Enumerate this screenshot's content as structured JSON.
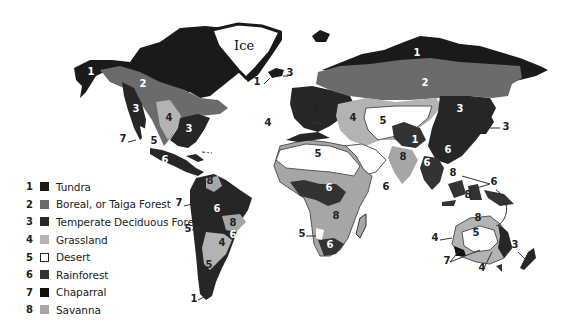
{
  "map": {
    "ice_label": "Ice",
    "colors": {
      "tundra": "#1a1a1a",
      "boreal": "#6b6b6b",
      "temperate": "#262626",
      "grassland": "#b3b3b3",
      "desert": "#ffffff",
      "rainforest": "#333333",
      "chaparral": "#111111",
      "savanna": "#a6a6a6",
      "outline": "#555555"
    },
    "region_labels": [
      {
        "text": "1",
        "x": 91,
        "y": 75
      },
      {
        "text": "2",
        "x": 143,
        "y": 87
      },
      {
        "text": "3",
        "x": 136,
        "y": 112
      },
      {
        "text": "4",
        "x": 169,
        "y": 121
      },
      {
        "text": "3",
        "x": 189,
        "y": 132
      },
      {
        "text": "7",
        "x": 123,
        "y": 142
      },
      {
        "text": "5",
        "x": 154,
        "y": 144
      },
      {
        "text": "6",
        "x": 208,
        "y": 155
      },
      {
        "text": "6",
        "x": 165,
        "y": 163
      },
      {
        "text": "1",
        "x": 257,
        "y": 85
      },
      {
        "text": "3",
        "x": 290,
        "y": 76
      },
      {
        "text": "4",
        "x": 268,
        "y": 126
      },
      {
        "text": "8",
        "x": 210,
        "y": 184
      },
      {
        "text": "7",
        "x": 179,
        "y": 206
      },
      {
        "text": "6",
        "x": 217,
        "y": 212
      },
      {
        "text": "8",
        "x": 233,
        "y": 226
      },
      {
        "text": "5",
        "x": 188,
        "y": 232
      },
      {
        "text": "4",
        "x": 222,
        "y": 246
      },
      {
        "text": "6",
        "x": 233,
        "y": 238
      },
      {
        "text": "5",
        "x": 209,
        "y": 268
      },
      {
        "text": "1",
        "x": 194,
        "y": 302
      },
      {
        "text": "1",
        "x": 417,
        "y": 56
      },
      {
        "text": "2",
        "x": 425,
        "y": 86
      },
      {
        "text": "3",
        "x": 316,
        "y": 112
      },
      {
        "text": "4",
        "x": 353,
        "y": 121
      },
      {
        "text": "5",
        "x": 383,
        "y": 124
      },
      {
        "text": "3",
        "x": 460,
        "y": 112
      },
      {
        "text": "3",
        "x": 506,
        "y": 130
      },
      {
        "text": "1",
        "x": 415,
        "y": 143
      },
      {
        "text": "5",
        "x": 318,
        "y": 157
      },
      {
        "text": "8",
        "x": 403,
        "y": 160
      },
      {
        "text": "6",
        "x": 448,
        "y": 153
      },
      {
        "text": "6",
        "x": 427,
        "y": 166
      },
      {
        "text": "6",
        "x": 386,
        "y": 190
      },
      {
        "text": "8",
        "x": 453,
        "y": 176
      },
      {
        "text": "6",
        "x": 329,
        "y": 191
      },
      {
        "text": "8",
        "x": 336,
        "y": 219
      },
      {
        "text": "6",
        "x": 494,
        "y": 185
      },
      {
        "text": "8",
        "x": 478,
        "y": 221
      },
      {
        "text": "5",
        "x": 302,
        "y": 237
      },
      {
        "text": "6",
        "x": 330,
        "y": 248
      },
      {
        "text": "4",
        "x": 435,
        "y": 241
      },
      {
        "text": "5",
        "x": 476,
        "y": 236
      },
      {
        "text": "3",
        "x": 515,
        "y": 248
      },
      {
        "text": "7",
        "x": 447,
        "y": 264
      },
      {
        "text": "4",
        "x": 482,
        "y": 271
      },
      {
        "text": "8",
        "x": 468,
        "y": 198
      }
    ]
  },
  "legend": {
    "items": [
      {
        "num": "1",
        "label": "Tundra",
        "color": "#1a1a1a"
      },
      {
        "num": "2",
        "label": "Boreal, or Taiga Forest",
        "color": "#6b6b6b"
      },
      {
        "num": "3",
        "label": "Temperate Deciduous Forest",
        "color": "#262626"
      },
      {
        "num": "4",
        "label": "Grassland",
        "color": "#b3b3b3"
      },
      {
        "num": "5",
        "label": "Desert",
        "color": "#ffffff"
      },
      {
        "num": "6",
        "label": "Rainforest",
        "color": "#333333"
      },
      {
        "num": "7",
        "label": "Chaparral",
        "color": "#111111"
      },
      {
        "num": "8",
        "label": "Savanna",
        "color": "#a6a6a6"
      }
    ]
  }
}
